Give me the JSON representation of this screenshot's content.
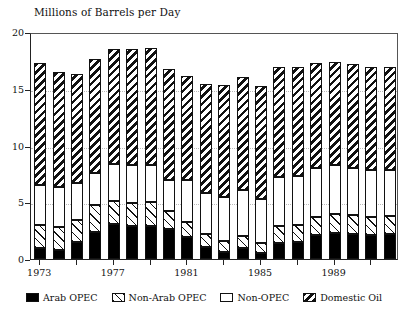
{
  "chart_data": {
    "type": "bar",
    "subtype": "stacked-bar",
    "title": "Millions of Barrels per Day",
    "xlabel": "",
    "ylabel": "",
    "ylim": [
      0,
      20
    ],
    "yticks": [
      0,
      5,
      10,
      15,
      20
    ],
    "ytick_labels": [
      "0",
      "5",
      "10",
      "15",
      "20"
    ],
    "grid": true,
    "legend_position": "bottom",
    "categories": [
      1973,
      1974,
      1975,
      1976,
      1977,
      1978,
      1979,
      1980,
      1981,
      1982,
      1983,
      1984,
      1985,
      1986,
      1987,
      1988,
      1989,
      1990,
      1991,
      1992
    ],
    "xtick_labels": [
      "1973",
      "1977",
      "1981",
      "1985",
      "1989"
    ],
    "xtick_categories": [
      1973,
      1977,
      1981,
      1985,
      1989
    ],
    "series": [
      {
        "name": "Arab OPEC",
        "pattern": "solid",
        "values": [
          1.0,
          0.8,
          1.5,
          2.4,
          3.1,
          2.9,
          2.9,
          2.6,
          1.9,
          1.1,
          0.6,
          1.0,
          0.5,
          1.4,
          1.5,
          2.1,
          2.3,
          2.2,
          2.1,
          2.2
        ]
      },
      {
        "name": "Non-Arab OPEC",
        "pattern": "light",
        "values": [
          2.0,
          2.0,
          1.9,
          2.4,
          2.0,
          2.0,
          2.1,
          1.6,
          1.4,
          1.1,
          1.0,
          1.0,
          0.9,
          1.5,
          1.5,
          1.6,
          1.7,
          1.7,
          1.6,
          1.6
        ]
      },
      {
        "name": "Non-OPEC",
        "pattern": "white",
        "values": [
          3.5,
          3.5,
          3.3,
          2.8,
          3.3,
          3.4,
          3.3,
          2.8,
          3.7,
          3.6,
          3.9,
          4.1,
          3.9,
          4.3,
          4.3,
          4.3,
          4.3,
          4.1,
          4.1,
          4.0
        ]
      },
      {
        "name": "Domestic Oil",
        "pattern": "dense",
        "values": [
          10.8,
          10.2,
          9.6,
          10.0,
          10.1,
          10.2,
          10.3,
          9.7,
          9.1,
          9.6,
          9.8,
          9.9,
          9.9,
          9.7,
          9.6,
          9.3,
          9.1,
          9.2,
          9.1,
          9.1
        ]
      }
    ],
    "totals": [
      17.3,
      16.5,
      16.3,
      17.6,
      18.5,
      18.5,
      18.6,
      16.7,
      16.1,
      15.4,
      15.3,
      16.0,
      15.2,
      16.9,
      16.9,
      17.3,
      17.4,
      17.2,
      16.9,
      16.9
    ]
  },
  "legend": {
    "items": [
      {
        "label": "Arab OPEC",
        "pattern": "solid"
      },
      {
        "label": "Non-Arab OPEC",
        "pattern": "light"
      },
      {
        "label": "Non-OPEC",
        "pattern": "white"
      },
      {
        "label": "Domestic Oil",
        "pattern": "dense"
      }
    ]
  },
  "colors": {
    "ink": "#111111",
    "axis": "#222222",
    "grid": "#b9b9b9",
    "background": "#ffffff"
  }
}
